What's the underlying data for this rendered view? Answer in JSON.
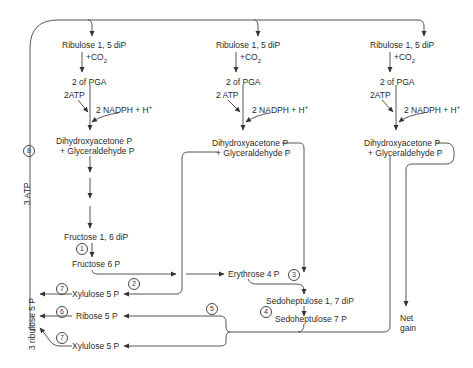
{
  "columns": [
    {
      "ribulose": "Ribulose 1, 5 diP",
      "co2": "+CO",
      "co2_sub": "2",
      "pga": "2 of PGA",
      "atp": "2ATP",
      "nadph": "2 NADPH + H",
      "nadph_sup": "+",
      "dhap": "Dihydroxyacetone P",
      "gap": "+ Glyceraldehyde P"
    },
    {
      "ribulose": "Ribulose 1, 5 diP",
      "co2": "+CO",
      "co2_sub": "2",
      "pga": "2 of PGA",
      "atp": "2 ATP",
      "nadph": "2 NADPH + H",
      "nadph_sup": "+",
      "dhap": "Dihydroxyacetone P",
      "gap": "+ Glyceraldehyde P"
    },
    {
      "ribulose": "Ribulose 1, 5 diP",
      "co2": "+CO",
      "co2_sub": "2",
      "pga": "2 of PGA",
      "atp": "2ATP",
      "nadph": "2 NADPH + H",
      "nadph_sup": "+",
      "dhap": "Dihydroxyacetone P",
      "gap": "+ Glyceraldehyde P"
    }
  ],
  "intermediates": {
    "fructose_16": "Fructose 1, 6 diP",
    "fructose_6": "Fructose 6 P",
    "erythrose": "Erythrose 4 P",
    "sedoheptulose_17": "Sedoheptulose 1, 7 diP",
    "sedoheptulose_7": "Sedoheptulose 7 P",
    "xylulose_top": "Xylulose 5 P",
    "ribose": "Ribose 5 P",
    "xylulose_bottom": "Xylulose 5 P",
    "net": "Net",
    "gain": "gain"
  },
  "left_loop": {
    "ribulose_total": "3 ribulose 5 P",
    "atp": "3 ATP"
  },
  "steps": [
    "1",
    "2",
    "3",
    "4",
    "5",
    "6",
    "7",
    "7",
    "8"
  ]
}
